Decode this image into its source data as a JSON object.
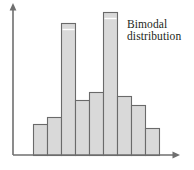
{
  "figure": {
    "width": 194,
    "height": 170,
    "background": "#ffffff"
  },
  "annotation": {
    "line1": "Bimodal",
    "line2": "distribution",
    "color": "#231f20"
  },
  "axes": {
    "color": "#6f6f6f",
    "origin_x": 13,
    "baseline_y": 155,
    "y_axis_top": 4,
    "x_axis_right": 180,
    "arrow": "arrowhead"
  },
  "style": {
    "bar_fill": "#d9d9d9",
    "bar_stroke": "#6a6a6a",
    "bar_stroke_width": 1.1,
    "highlight_line": "#ffffff"
  },
  "chart_data": {
    "type": "bar",
    "title": "",
    "subtitle": "",
    "xlabel": "",
    "ylabel": "",
    "grid": false,
    "legend": false,
    "annotations": [
      "Bimodal",
      "distribution"
    ],
    "categories": [
      "1",
      "2",
      "3",
      "4",
      "5",
      "6",
      "7",
      "8",
      "9"
    ],
    "values": [
      31,
      38,
      132,
      55,
      63,
      143,
      59,
      50,
      27
    ],
    "ylim": [
      0,
      151
    ],
    "xlim": [
      0,
      9
    ],
    "bar_left_px": [
      33,
      47,
      61,
      75,
      89,
      103,
      117,
      131,
      145
    ],
    "bar_width_px": 14,
    "bar_top_px": [
      124,
      117,
      23,
      100,
      92,
      12,
      96,
      105,
      128
    ],
    "baseline_px": 155
  }
}
